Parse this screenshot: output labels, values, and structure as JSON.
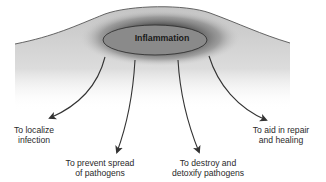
{
  "diagram": {
    "center": {
      "label": "Inflammation",
      "fill": "#8a8a8a",
      "glow": "#5a5a5a"
    },
    "tissue": {
      "fill_top": "#c8c8c8",
      "fill_bottom": "#f2f2f2",
      "outline": "#555555"
    },
    "outcomes": [
      {
        "line1": "To localize",
        "line2": "infection"
      },
      {
        "line1": "To prevent spread",
        "line2": "of pathogens"
      },
      {
        "line1": "To destroy and",
        "line2": "detoxify pathogens"
      },
      {
        "line1": "To aid in repair",
        "line2": "and healing"
      }
    ],
    "arrow_color": "#333333"
  }
}
